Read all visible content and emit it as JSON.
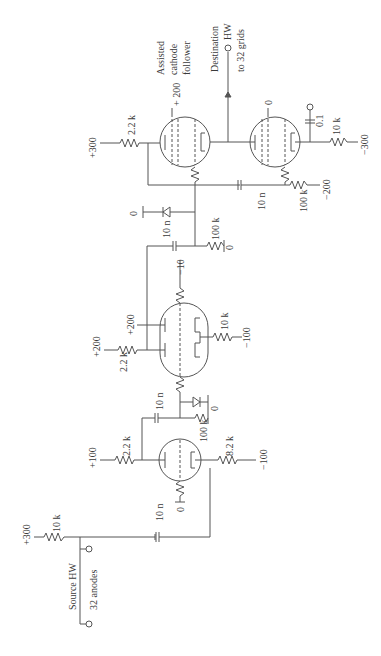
{
  "figure": {
    "orientation": "rotated-90-ccw",
    "labels": {
      "source_hw": "Source HW",
      "anodes": "32 anodes",
      "destination": "Destination",
      "dest_hw": "HW",
      "to_grids": "to 32 grids",
      "assisted": "Assisted",
      "cathode": "cathode",
      "follower": "follower"
    },
    "supplies": {
      "v_in": "+300",
      "v_stage1": "+100",
      "v_stage2_anode": "+200",
      "v_stage2_screen": "+200",
      "v_stage3": "+300",
      "v_cf_screen": "+ 200",
      "v_stage1_cathode": "−100",
      "v_stage2_cathode": "−100",
      "v_bias_mid": "−10",
      "v_bias_out": "−200",
      "v_out_cathode": "−300",
      "zero": "0"
    },
    "components": {
      "r_in": "10 k",
      "c_in": "10 n",
      "r_a1": "2.2 k",
      "r_g1": "100 k",
      "r_k1": "8.2 k",
      "c_12": "10 n",
      "r_a2": "2.2 k",
      "r_k2": "10 k",
      "c_23": "10 n",
      "r_g3": "100 k",
      "r_a3": "2.2 k",
      "c_34": "10 n",
      "r_g4": "100 k",
      "c_out": "0.1",
      "r_out": "10 k"
    }
  }
}
